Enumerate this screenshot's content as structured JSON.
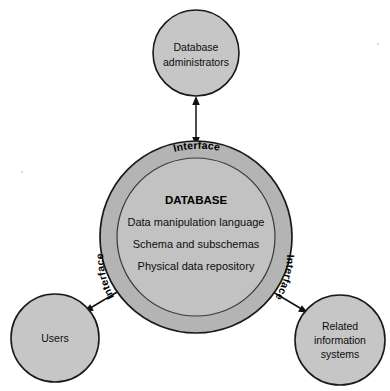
{
  "diagram": {
    "type": "concentric-circle-relationship",
    "colors": {
      "node_fill": "#c6c6c6",
      "ring_fill": "#b4b4b4",
      "core_fill": "#c2c2c2",
      "outline": "#1a1a1a",
      "text": "#0d0d0d",
      "background": "#ffffff"
    },
    "core": {
      "heading": "DATABASE",
      "lines": [
        "Data manipulation language",
        "Schema and subschemas",
        "Physical data repository"
      ]
    },
    "ring_labels": [
      {
        "id": "interface-top",
        "text": "Interface",
        "position": "top"
      },
      {
        "id": "interface-left",
        "text": "Interface",
        "position": "lower-left"
      },
      {
        "id": "interface-right",
        "text": "Interface",
        "position": "lower-right"
      }
    ],
    "nodes": [
      {
        "id": "database-administrators",
        "lines": [
          "Database",
          "administrators"
        ],
        "position": "top"
      },
      {
        "id": "users",
        "lines": [
          "Users"
        ],
        "position": "bottom-left"
      },
      {
        "id": "related-information-systems",
        "lines": [
          "Related",
          "information",
          "systems"
        ],
        "position": "bottom-right"
      }
    ],
    "connectors": [
      {
        "id": "admins-to-database",
        "from": "database-administrators",
        "to": "database-core",
        "arrows": "both"
      },
      {
        "id": "users-to-database",
        "from": "users",
        "to": "database-core",
        "arrows": "both"
      },
      {
        "id": "systems-to-database",
        "from": "related-information-systems",
        "to": "database-core",
        "arrows": "both"
      }
    ]
  }
}
